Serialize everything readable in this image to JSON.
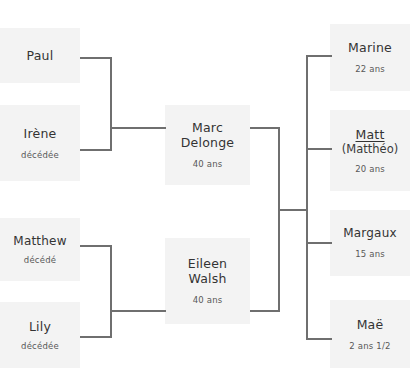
{
  "title": "",
  "colors": {
    "page_background": "#ffffff",
    "card_background": "#f3f3f3",
    "connector": "#6f6f6f",
    "name_text": "#333333",
    "sub_text": "#585858"
  },
  "generations": {
    "grandparents": [
      {
        "name": "Paul",
        "status": "",
        "age": ""
      },
      {
        "name": "Irène",
        "status": "décédée",
        "age": ""
      },
      {
        "name": "Matthew",
        "status": "décédé",
        "age": ""
      },
      {
        "name": "Lily",
        "status": "décédée",
        "age": ""
      }
    ],
    "parents": [
      {
        "first_name": "Marc",
        "last_name": "Delonge",
        "age": "40 ans"
      },
      {
        "first_name": "Eileen",
        "last_name": "Walsh",
        "age": "40 ans"
      }
    ],
    "children": [
      {
        "name": "Marine",
        "alias": "",
        "age": "22 ans",
        "highlighted": false
      },
      {
        "name": "Matt",
        "alias": "(Matthéo)",
        "age": "20 ans",
        "highlighted": true
      },
      {
        "name": "Margaux",
        "alias": "",
        "age": "15 ans",
        "highlighted": false
      },
      {
        "name": "Maë",
        "alias": "",
        "age": "2 ans 1/2",
        "highlighted": false
      }
    ]
  }
}
